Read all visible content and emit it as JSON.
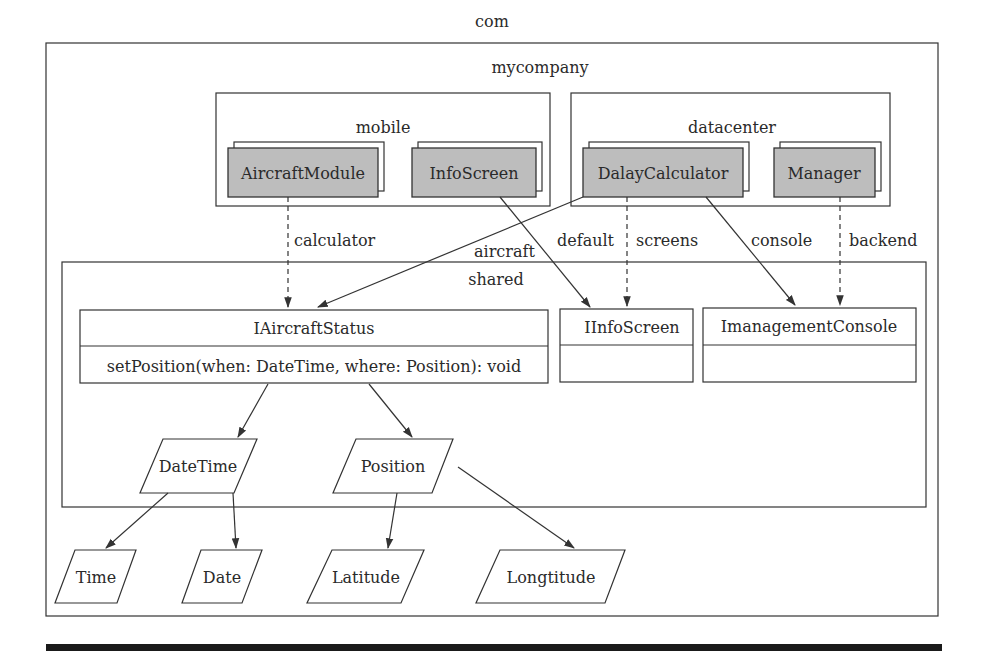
{
  "packages": {
    "root": "com",
    "company": "mycompany",
    "mobile": "mobile",
    "datacenter": "datacenter",
    "shared": "shared"
  },
  "components": {
    "aircraft_module": "AircraftModule",
    "info_screen": "InfoScreen",
    "delay_calculator": "DalayCalculator",
    "manager": "Manager"
  },
  "interfaces": {
    "aircraft_status": {
      "name": "IAircraftStatus",
      "method": "setPosition(when: DateTime, where: Position): void"
    },
    "info_screen": {
      "name": "IInfoScreen",
      "method": ""
    },
    "management_console": {
      "name": "ImanagementConsole",
      "method": ""
    }
  },
  "types": {
    "datetime": "DateTime",
    "position": "Position",
    "time": "Time",
    "date": "Date",
    "latitude": "Latitude",
    "longitude": "Longtitude"
  },
  "edge_labels": {
    "calculator": "calculator",
    "aircraft": "aircraft",
    "default": "default",
    "screens": "screens",
    "console": "console",
    "backend": "backend"
  },
  "colors": {
    "component_fill": "#bdbdbd",
    "stroke": "#333333",
    "footer_bar": "#1a1a1a"
  }
}
